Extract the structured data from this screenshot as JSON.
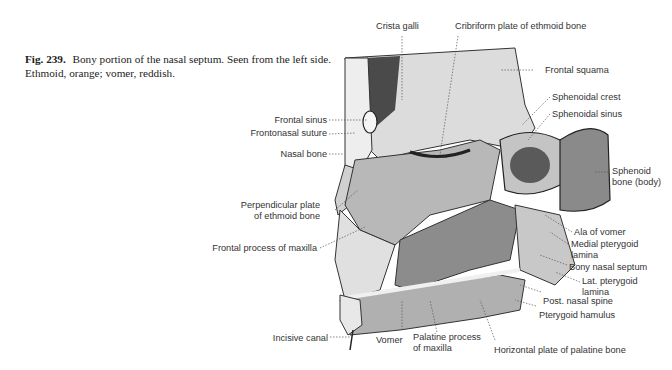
{
  "caption": {
    "figure_number": "Fig. 239.",
    "text": "Bony portion of the nasal septum. Seen from the left side. Ethmoid, orange; vomer, reddish."
  },
  "labels": {
    "crista_galli": "Crista galli",
    "cribriform_plate": "Cribriform plate of ethmoid bone",
    "frontal_squama": "Frontal squama",
    "sphenoidal_crest": "Sphenoidal crest",
    "sphenoidal_sinus": "Sphenoidal sinus",
    "frontal_sinus": "Frontal sinus",
    "frontonasal_suture": "Frontonasal suture",
    "nasal_bone": "Nasal bone",
    "sphenoid_body_1": "Sphenoid",
    "sphenoid_body_2": "bone (body)",
    "perpendicular_plate_1": "Perpendicular plate",
    "perpendicular_plate_2": "of ethmoid bone",
    "frontal_process_maxilla": "Frontal process of maxilla",
    "ala_of_vomer": "Ala of vomer",
    "medial_pterygoid_1": "Medial pterygoid",
    "medial_pterygoid_2": "lamina",
    "bony_nasal_septum": "Bony nasal septum",
    "lat_pterygoid_1": "Lat. pterygoid",
    "lat_pterygoid_2": "lamina",
    "post_nasal_spine": "Post. nasal spine",
    "pterygoid_hamulus": "Pterygoid hamulus",
    "incisive_canal": "Incisive canal",
    "vomer": "Vomer",
    "palatine_process_1": "Palatine process",
    "palatine_process_2": "of maxilla",
    "horizontal_plate": "Horizontal plate of palatine bone"
  },
  "colors": {
    "bone_light": "#d8d8d8",
    "bone_mid": "#a8a8a8",
    "vomer": "#8c8c8c",
    "shadow": "#3a3a3a",
    "leader": "#555555"
  }
}
